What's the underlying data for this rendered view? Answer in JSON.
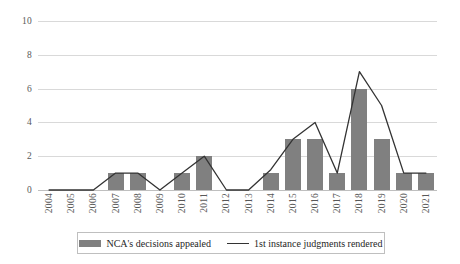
{
  "chart_data": {
    "type": "bar",
    "title": "",
    "subtitle": "",
    "xlabel": "",
    "ylabel": "",
    "ylim": [
      0,
      10
    ],
    "yticks": [
      0,
      2,
      4,
      6,
      8,
      10
    ],
    "grid": true,
    "legend_position": "bottom",
    "categories": [
      "2004",
      "2005",
      "2006",
      "2007",
      "2008",
      "2009",
      "2010",
      "2011",
      "2012",
      "2013",
      "2014",
      "2015",
      "2016",
      "2017",
      "2018",
      "2019",
      "2020",
      "2021"
    ],
    "series": [
      {
        "name": "NCA's decisions appealed",
        "type": "bar",
        "color": "#808080",
        "values": [
          0,
          0,
          0,
          1,
          1,
          0,
          1,
          2,
          0,
          0,
          1,
          3,
          3,
          1,
          6,
          3,
          1,
          1
        ]
      },
      {
        "name": "1st instance judgments rendered",
        "type": "line",
        "color": "#333333",
        "values": [
          0,
          0,
          0,
          1,
          1,
          0,
          1,
          2,
          0,
          0,
          1.2,
          3,
          4,
          1,
          7,
          5,
          1,
          1
        ]
      }
    ]
  },
  "legend": {
    "entries": [
      {
        "label": "NCA's decisions appealed",
        "marker": "bar-swatch"
      },
      {
        "label": "1st instance judgments rendered",
        "marker": "line-swatch"
      }
    ]
  },
  "axis": {
    "y_tick_labels": [
      "10",
      "8",
      "6",
      "4",
      "2",
      "0"
    ],
    "x_tick_labels": [
      "2004",
      "2005",
      "2006",
      "2007",
      "2008",
      "2009",
      "2010",
      "2011",
      "2012",
      "2013",
      "2014",
      "2015",
      "2016",
      "2017",
      "2018",
      "2019",
      "2020",
      "2021"
    ]
  },
  "colors": {
    "bar": "#808080",
    "line": "#333333",
    "gridline": "#d9d9d9",
    "axis_text": "#595959",
    "legend_border": "#bfbfbf",
    "background": "#ffffff"
  }
}
